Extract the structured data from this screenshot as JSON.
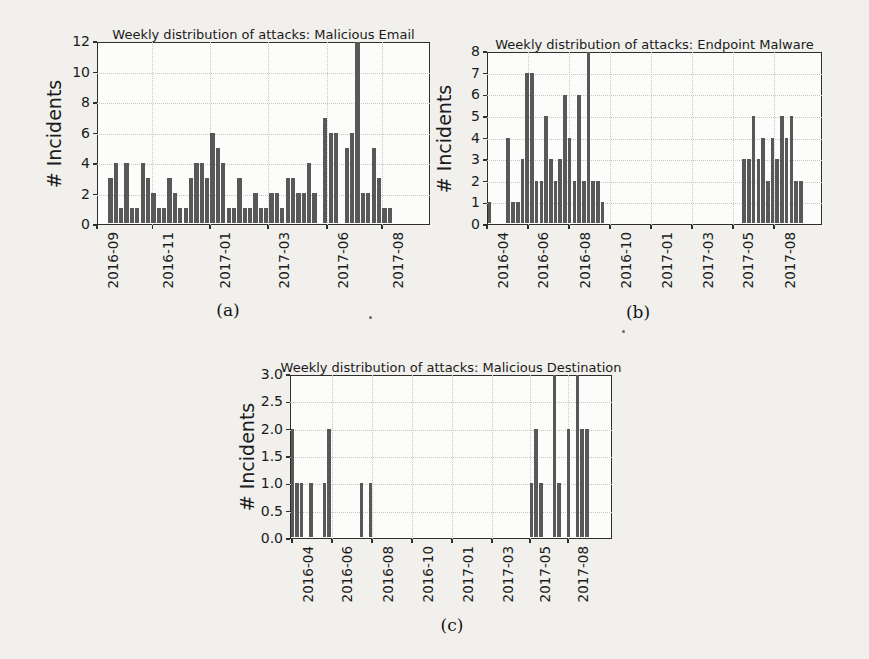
{
  "figure": {
    "bar_color": "#585858",
    "plot_border_color": "#2e2e2e",
    "grid_color": "#ccc4c2",
    "text_color": "#1b1b1b",
    "grid": "on",
    "legend": "none"
  },
  "chart_data": [
    {
      "type": "bar",
      "caption": "(a)",
      "title": "Weekly distribution of attacks: Malicious Email",
      "ylabel": "# Incidents",
      "xlabel": "",
      "ylim": [
        0,
        12
      ],
      "y_ticks": [
        "0",
        "2",
        "4",
        "6",
        "8",
        "10",
        "12"
      ],
      "x_ticks": [
        "2016-09",
        "2016-11",
        "2017-01",
        "2017-03",
        "2017-06",
        "2017-08"
      ],
      "x_tick_fracs": [
        0,
        0.166,
        0.339,
        0.514,
        0.691,
        0.856
      ],
      "x_unit": "week",
      "x_range": [
        "2016-09",
        "2017-09"
      ],
      "values": [
        0,
        0,
        3,
        4,
        1,
        4,
        1,
        1,
        4,
        3,
        2,
        1,
        1,
        3,
        2,
        1,
        1,
        3,
        4,
        4,
        3,
        6,
        5,
        4,
        1,
        1,
        3,
        1,
        1,
        2,
        1,
        1,
        2,
        2,
        1,
        3,
        3,
        2,
        2,
        4,
        2,
        0,
        7,
        6,
        6,
        0,
        5,
        6,
        12,
        2,
        2,
        5,
        3,
        1,
        1,
        0,
        0,
        0,
        0,
        0,
        0,
        0
      ]
    },
    {
      "type": "bar",
      "caption": "(b)",
      "title": "Weekly distribution of attacks: Endpoint Malware",
      "ylabel": "# Incidents",
      "xlabel": "",
      "ylim": [
        0,
        8
      ],
      "y_ticks": [
        "0",
        "1",
        "2",
        "3",
        "4",
        "5",
        "6",
        "7",
        "8"
      ],
      "x_ticks": [
        "2016-04",
        "2016-06",
        "2016-08",
        "2016-10",
        "2017-01",
        "2017-03",
        "2017-05",
        "2017-08"
      ],
      "x_tick_fracs": [
        0,
        0.122,
        0.245,
        0.367,
        0.49,
        0.612,
        0.734,
        0.857
      ],
      "x_unit": "week",
      "x_range": [
        "2016-04",
        "2017-09"
      ],
      "values": [
        1,
        0,
        0,
        0,
        4,
        1,
        1,
        3,
        7,
        7,
        2,
        2,
        5,
        3,
        2,
        3,
        6,
        4,
        2,
        6,
        2,
        8,
        2,
        2,
        1,
        0,
        0,
        0,
        0,
        0,
        0,
        0,
        0,
        0,
        0,
        0,
        0,
        0,
        0,
        0,
        0,
        0,
        0,
        0,
        0,
        0,
        0,
        0,
        0,
        0,
        0,
        0,
        0,
        0,
        3,
        3,
        5,
        3,
        4,
        2,
        4,
        3,
        5,
        4,
        5,
        2,
        2,
        0,
        0,
        0,
        0
      ]
    },
    {
      "type": "bar",
      "caption": "(c)",
      "title": "Weekly distribution of attacks: Malicious Destination",
      "ylabel": "# Incidents",
      "xlabel": "",
      "ylim": [
        0,
        3
      ],
      "y_ticks": [
        "0.0",
        "0.5",
        "1.0",
        "1.5",
        "2.0",
        "2.5",
        "3.0"
      ],
      "x_ticks": [
        "2016-04",
        "2016-06",
        "2016-08",
        "2016-10",
        "2017-01",
        "2017-03",
        "2017-05",
        "2017-08"
      ],
      "x_tick_fracs": [
        0.006,
        0.13,
        0.255,
        0.379,
        0.503,
        0.627,
        0.745,
        0.863
      ],
      "x_unit": "week",
      "x_range": [
        "2016-04",
        "2017-09"
      ],
      "values": [
        2,
        1,
        1,
        0,
        1,
        0,
        0,
        1,
        2,
        0,
        0,
        0,
        0,
        0,
        0,
        1,
        0,
        1,
        0,
        0,
        0,
        0,
        0,
        0,
        0,
        0,
        0,
        0,
        0,
        0,
        0,
        0,
        0,
        0,
        0,
        0,
        0,
        0,
        0,
        0,
        0,
        0,
        0,
        0,
        0,
        0,
        0,
        0,
        0,
        0,
        0,
        0,
        1,
        2,
        1,
        0,
        0,
        3,
        1,
        0,
        2,
        0,
        3,
        2,
        2,
        0,
        0,
        0,
        0,
        0
      ]
    }
  ]
}
